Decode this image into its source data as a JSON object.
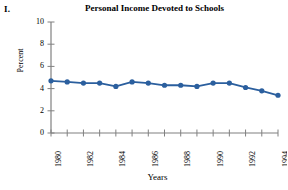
{
  "figure": {
    "label": "I."
  },
  "chart_data": {
    "type": "line",
    "title": "Personal Income Devoted to Schools",
    "xlabel": "Years",
    "ylabel": "Percent",
    "x": [
      1980,
      1981,
      1982,
      1983,
      1984,
      1985,
      1986,
      1987,
      1988,
      1989,
      1990,
      1991,
      1992,
      1993,
      1994
    ],
    "values": [
      4.7,
      4.6,
      4.5,
      4.5,
      4.2,
      4.6,
      4.5,
      4.3,
      4.3,
      4.2,
      4.5,
      4.5,
      4.1,
      3.8,
      3.4
    ],
    "categories": [
      "1980",
      "1981",
      "1982",
      "1983",
      "1984",
      "1985",
      "1986",
      "1987",
      "1988",
      "1989",
      "1990",
      "1991",
      "1992",
      "1993",
      "1994"
    ],
    "xtick_labels": [
      "1980",
      "1982",
      "1984",
      "1986",
      "1988",
      "1990",
      "1992",
      "1994"
    ],
    "xtick_label_years": [
      1980,
      1982,
      1984,
      1986,
      1988,
      1990,
      1992,
      1994
    ],
    "ytick_labels": [
      "0",
      "2",
      "4",
      "6",
      "8",
      "10"
    ],
    "ytick_values": [
      0,
      2,
      4,
      6,
      8,
      10
    ],
    "ylim": [
      0,
      10
    ],
    "xlim": [
      1980,
      1994
    ],
    "grid": false,
    "legend": false,
    "series_color": "#2b5f9e",
    "marker": "circle",
    "axis_color": "#808080"
  }
}
